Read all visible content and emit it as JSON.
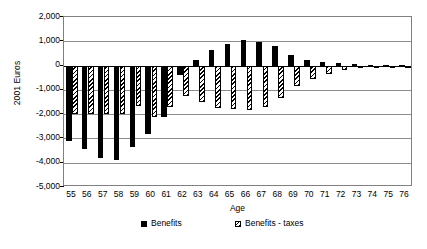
{
  "chart_data": {
    "type": "bar",
    "title": "",
    "xlabel": "Age",
    "ylabel": "2001 Euros",
    "ylim": [
      -5000,
      2000
    ],
    "ytick_step": 1000,
    "grid": true,
    "legend_position": "bottom",
    "yticks": [
      "2,000",
      "1,000",
      "0",
      "-1,000",
      "-2,000",
      "-3,000",
      "-4,000",
      "-5,000"
    ],
    "ytick_values": [
      2000,
      1000,
      0,
      -1000,
      -2000,
      -3000,
      -4000,
      -5000
    ],
    "categories": [
      "55",
      "56",
      "57",
      "58",
      "59",
      "60",
      "61",
      "62",
      "63",
      "64",
      "65",
      "66",
      "67",
      "68",
      "69",
      "70",
      "71",
      "72",
      "73",
      "74",
      "75",
      "76"
    ],
    "series": [
      {
        "name": "Benefits",
        "style": "solid-black",
        "values": [
          -3100,
          -3450,
          -3800,
          -3900,
          -3350,
          -2800,
          -2100,
          -380,
          250,
          650,
          880,
          1050,
          980,
          800,
          450,
          250,
          150,
          90,
          60,
          40,
          25,
          15
        ]
      },
      {
        "name": "Benefits - taxes",
        "style": "diagonal-hatch",
        "values": [
          -2000,
          -2000,
          -2000,
          -2000,
          -1650,
          -2100,
          -1700,
          -1250,
          -1500,
          -1750,
          -1800,
          -1820,
          -1700,
          -1350,
          -850,
          -550,
          -330,
          -180,
          -100,
          -60,
          -40,
          -25
        ]
      }
    ]
  },
  "legend": {
    "entries": [
      {
        "label": "Benefits",
        "swatch": "solid-black-swatch"
      },
      {
        "label": "Benefits - taxes",
        "swatch": "hatched-swatch"
      }
    ]
  },
  "colors": {
    "benefits": "#000000",
    "benefits_taxes_outline": "#000000",
    "benefits_taxes_fill": "#ffffff",
    "gridline": "#8c8c8c",
    "axis": "#000000",
    "plot_background": "#ffffff"
  }
}
